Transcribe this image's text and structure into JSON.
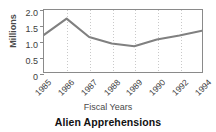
{
  "chart_data": {
    "type": "line",
    "title": "Alien Apprehensions",
    "xlabel": "Fiscal Years",
    "ylabel": "Millions",
    "categories": [
      "1985",
      "1986",
      "1987",
      "1988",
      "1989",
      "1990",
      "1992",
      "1994"
    ],
    "values": [
      1.2,
      1.72,
      1.13,
      0.92,
      0.83,
      1.05,
      1.18,
      1.33
    ],
    "series": [
      {
        "name": "Alien Apprehensions",
        "values": [
          1.2,
          1.72,
          1.13,
          0.92,
          0.83,
          1.05,
          1.18,
          1.33
        ]
      }
    ],
    "yticks": [
      "2.0",
      "1.5",
      "1.0",
      "0.5",
      "0"
    ],
    "ytick_values": [
      2.0,
      1.5,
      1.0,
      0.5,
      0
    ],
    "ylim": [
      0,
      2.0
    ],
    "xtick_labels": [
      "1985",
      "1986",
      "1987",
      "1988",
      "1989",
      "1990",
      "1992",
      "1994"
    ],
    "grid": "vertical-dotted",
    "legend": "none",
    "line_color": "#808080",
    "frame_color": "#8a8a8a",
    "grid_color": "#c9c9c9",
    "background": "#ffffff"
  }
}
